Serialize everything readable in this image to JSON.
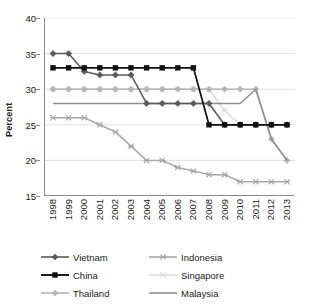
{
  "chart_data": {
    "type": "line",
    "title": "",
    "xlabel": "",
    "ylabel": "Percent",
    "ylim": [
      15,
      40
    ],
    "yticks": [
      15,
      20,
      25,
      30,
      35,
      40
    ],
    "grid": "horizontal",
    "legend_position": "bottom",
    "categories": [
      "1998",
      "1999",
      "2000",
      "2001",
      "2002",
      "2003",
      "2004",
      "2005",
      "2006",
      "2007",
      "2008",
      "2009",
      "2010",
      "2011",
      "2012",
      "2013"
    ],
    "series": [
      {
        "name": "Vietnam",
        "color": "#5a5a5a",
        "marker": "diamond",
        "values": [
          35,
          35,
          32.5,
          32,
          32,
          32,
          28,
          28,
          28,
          28,
          28,
          25,
          25,
          25,
          25,
          25
        ]
      },
      {
        "name": "China",
        "color": "#101010",
        "marker": "square",
        "values": [
          33,
          33,
          33,
          33,
          33,
          33,
          33,
          33,
          33,
          33,
          25,
          25,
          25,
          25,
          25,
          25
        ]
      },
      {
        "name": "Thailand",
        "color": "#b5b5b5",
        "marker": "diamond",
        "values": [
          30,
          30,
          30,
          30,
          30,
          30,
          30,
          30,
          30,
          30,
          30,
          30,
          30,
          30,
          23,
          20
        ]
      },
      {
        "name": "Indonesia",
        "color": "#a8a8a8",
        "marker": "x",
        "values": [
          26,
          26,
          26,
          25,
          24,
          22,
          20,
          20,
          19,
          18.5,
          18,
          18,
          17,
          17,
          17,
          17
        ]
      },
      {
        "name": "Singapore",
        "color": "#dcdcdc",
        "marker": "x",
        "values": [
          30,
          30,
          30,
          30,
          30,
          30,
          30,
          30,
          30,
          30,
          30,
          27,
          25,
          25,
          25,
          25
        ]
      },
      {
        "name": "Malaysia",
        "color": "#8e8e8e",
        "marker": "none",
        "values": [
          28,
          28,
          28,
          28,
          28,
          28,
          28,
          28,
          28,
          28,
          28,
          28,
          28,
          30,
          23,
          20
        ]
      }
    ]
  },
  "legend": {
    "items": [
      {
        "label": "Vietnam",
        "key": "Vietnam"
      },
      {
        "label": "Indonesia",
        "key": "Indonesia"
      },
      {
        "label": "China",
        "key": "China"
      },
      {
        "label": "Singapore",
        "key": "Singapore"
      },
      {
        "label": "Thailand",
        "key": "Thailand"
      },
      {
        "label": "Malaysia",
        "key": "Malaysia"
      }
    ]
  }
}
